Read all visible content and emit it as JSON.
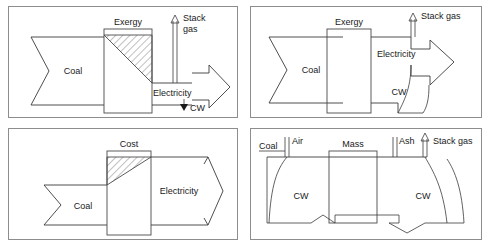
{
  "figure": {
    "panel_count": 4,
    "background_color": "#ffffff",
    "line_color": "#3a3a3a",
    "border_color": "#8d8d8d",
    "text_color": "#1a1a1a"
  },
  "panels": [
    {
      "id": "top-left",
      "name": "exergy-flow-diagram-with-destruction",
      "box_label": "Exergy",
      "hatched": true,
      "hatch_region": "upper-right-triangle",
      "inflow": {
        "label": "Coal",
        "tail": "notched-chevron",
        "direction": "right"
      },
      "outflows": [
        {
          "label": "Stack gas",
          "direction": "up",
          "style": "thin-arrow"
        },
        {
          "label": "Electricity",
          "direction": "right",
          "style": "wide-block-arrow"
        },
        {
          "label": "CW",
          "direction": "down",
          "style": "small-solid-arrow"
        }
      ]
    },
    {
      "id": "top-right",
      "name": "exergy-flow-diagram-plain",
      "box_label": "Exergy",
      "hatched": false,
      "hatch_region": "",
      "inflow": {
        "label": "Coal",
        "tail": "notched-chevron",
        "direction": "right"
      },
      "outflows": [
        {
          "label": "Stack gas",
          "direction": "up",
          "style": "thin-arrow"
        },
        {
          "label": "Electricity",
          "direction": "right",
          "style": "wide-block-arrow"
        },
        {
          "label": "CW",
          "direction": "down",
          "style": "curved-band-arrow"
        }
      ]
    },
    {
      "id": "bottom-left",
      "name": "cost-flow-diagram",
      "box_label": "Cost",
      "hatched": true,
      "hatch_region": "upper-left-triangle",
      "inflow": {
        "label": "Coal",
        "tail": "notched-chevron",
        "direction": "right"
      },
      "outflows": [
        {
          "label": "Electricity",
          "direction": "right",
          "style": "chevron-arrow"
        }
      ]
    },
    {
      "id": "bottom-right",
      "name": "mass-flow-diagram",
      "box_label": "Mass",
      "hatched": false,
      "hatch_region": "",
      "inflow": {
        "label": "Coal",
        "tail": "plain",
        "direction": "right"
      },
      "outflows": [
        {
          "label": "Air",
          "direction": "down",
          "style": "thin-line"
        },
        {
          "label": "Ash",
          "direction": "down",
          "style": "thin-line"
        },
        {
          "label": "Stack gas",
          "direction": "up",
          "style": "thin-arrow"
        },
        {
          "label": "CW",
          "direction": "right",
          "style": "notched-band-inflow"
        },
        {
          "label": "CW",
          "direction": "right",
          "style": "arrow-band-outflow"
        }
      ]
    }
  ],
  "labels": {
    "exergy": "Exergy",
    "cost": "Cost",
    "mass": "Mass",
    "coal": "Coal",
    "electricity": "Electricity",
    "stack_gas": "Stack gas",
    "stack": "Stack",
    "gas": "gas",
    "cw": "CW",
    "air": "Air",
    "ash": "Ash"
  }
}
